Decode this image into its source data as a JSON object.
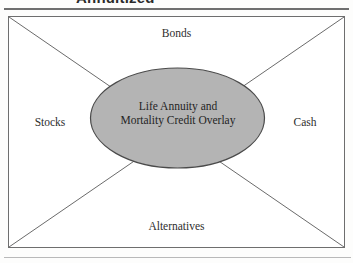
{
  "heading": {
    "text": "Annuitized"
  },
  "figure": {
    "center": {
      "line1": "Life Annuity and",
      "line2": "Mortality Credit Overlay"
    },
    "quadrants": {
      "top": "Bonds",
      "left": "Stocks",
      "right": "Cash",
      "bottom": "Alternatives"
    },
    "ghost_marks": {
      "left": "",
      "right": ""
    }
  },
  "colors": {
    "page_background": "#fdfdfc",
    "ellipse_fill": "#b4b4b4",
    "ellipse_stroke": "#4a4a4a",
    "box_stroke": "#6e6e6e",
    "diagonal_stroke": "#6b6b6b",
    "rule_top": "#6f6f6f",
    "rule_bottom": "#b9b9b9",
    "text": "#2e2e2e"
  }
}
